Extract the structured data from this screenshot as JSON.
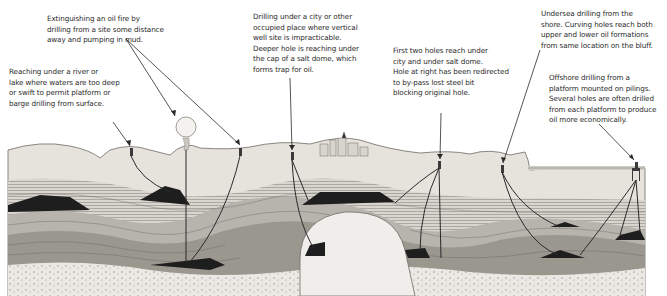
{
  "diagram": {
    "type": "cross-section illustration",
    "captions": [
      {
        "id": "oil-fire",
        "lines": [
          "Extinguishing an oil fire by",
          "drilling from a site some distance",
          "away and pumping in mud."
        ]
      },
      {
        "id": "river",
        "lines": [
          "Reaching under a river or",
          "lake where waters are too deep",
          "or swift to permit platform or",
          "barge drilling from surface."
        ]
      },
      {
        "id": "city",
        "lines": [
          "Drilling under a city or other",
          "occupied place where vertical",
          "well site is impracticable.",
          "Deeper hole is reaching under",
          "the cap of a salt dome, which",
          "forms trap for oil."
        ]
      },
      {
        "id": "salt-dome",
        "lines": [
          "First two holes reach under",
          "city and under salt dome.",
          "Hole at right has been redirected",
          "to by-pass lost steel bit",
          "blocking original hole."
        ]
      },
      {
        "id": "undersea",
        "lines": [
          "Undersea drilling from the",
          "shore. Curving holes reach both",
          "upper and lower oil formations",
          "from same location on  the bluff."
        ]
      },
      {
        "id": "offshore",
        "lines": [
          "Offshore drilling from a",
          "platform mounted on pilings.",
          "Several holes are often drilled",
          "from each platform to produce",
          "oil more economically."
        ]
      }
    ],
    "colors": {
      "ink": "#2a2a2a",
      "oil": "#1e1e1e",
      "strata_light": "#e4e2dc",
      "strata_dark": "#7a7873",
      "salt_dome": "#eeeeec",
      "background": "#ffffff"
    }
  }
}
